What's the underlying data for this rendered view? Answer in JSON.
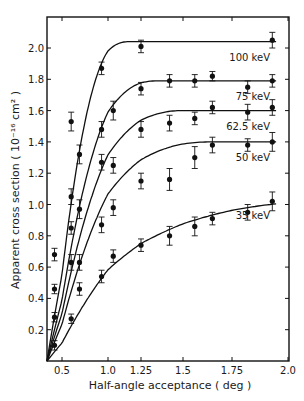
{
  "chart_data": {
    "type": "line",
    "title": "",
    "xlabel": "Half-angle acceptance ( deg )",
    "ylabel": "Apparent cross section ( 10⁻¹⁶ cm² )",
    "xlim": [
      0.4,
      2.0
    ],
    "ylim": [
      0,
      2.2
    ],
    "grid": false,
    "legend_position": "inline labels at right",
    "x_ticks": [
      {
        "label": "0.5",
        "px": 62
      },
      {
        "label": "1.0",
        "px": 108
      },
      {
        "label": "1.25",
        "px": 141
      },
      {
        "label": "1.5",
        "px": 183
      },
      {
        "label": "1.75",
        "px": 232
      },
      {
        "label": "2.0",
        "px": 288
      }
    ],
    "y_ticks": [
      "0.2",
      "0.4",
      "0.6",
      "0.8",
      "1.0",
      "1.2",
      "1.4",
      "1.6",
      "1.8",
      "2.0"
    ],
    "series": [
      {
        "name": "100 keV",
        "label": "100 keV",
        "plateau": 2.04,
        "points": [
          {
            "x": 0.6,
            "y": 1.53,
            "err": 0.06
          },
          {
            "x": 0.93,
            "y": 1.87,
            "err": 0.04
          },
          {
            "x": 1.25,
            "y": 2.01,
            "err": 0.04
          },
          {
            "x": 1.93,
            "y": 2.05,
            "err": 0.05
          }
        ]
      },
      {
        "name": "75 keV",
        "label": "75 keV",
        "plateau": 1.79,
        "points": [
          {
            "x": 0.45,
            "y": 0.68,
            "err": 0.04
          },
          {
            "x": 0.69,
            "y": 1.32,
            "err": 0.06
          },
          {
            "x": 0.93,
            "y": 1.48,
            "err": 0.05
          },
          {
            "x": 1.04,
            "y": 1.6,
            "err": 0.06
          },
          {
            "x": 1.25,
            "y": 1.74,
            "err": 0.04
          },
          {
            "x": 1.42,
            "y": 1.79,
            "err": 0.04
          },
          {
            "x": 1.56,
            "y": 1.79,
            "err": 0.04
          },
          {
            "x": 1.65,
            "y": 1.82,
            "err": 0.03
          },
          {
            "x": 1.82,
            "y": 1.75,
            "err": 0.04
          },
          {
            "x": 1.93,
            "y": 1.79,
            "err": 0.04
          }
        ]
      },
      {
        "name": "62.5 keV",
        "label": "62.5 keV",
        "plateau": 1.6,
        "points": [
          {
            "x": 0.45,
            "y": 0.46,
            "err": 0.03
          },
          {
            "x": 0.6,
            "y": 1.05,
            "err": 0.05
          },
          {
            "x": 0.69,
            "y": 0.97,
            "err": 0.06
          },
          {
            "x": 0.93,
            "y": 1.27,
            "err": 0.05
          },
          {
            "x": 1.04,
            "y": 1.25,
            "err": 0.05
          },
          {
            "x": 1.25,
            "y": 1.48,
            "err": 0.05
          },
          {
            "x": 1.42,
            "y": 1.52,
            "err": 0.05
          },
          {
            "x": 1.56,
            "y": 1.55,
            "err": 0.04
          },
          {
            "x": 1.65,
            "y": 1.62,
            "err": 0.04
          },
          {
            "x": 1.82,
            "y": 1.59,
            "err": 0.05
          },
          {
            "x": 1.93,
            "y": 1.62,
            "err": 0.05
          }
        ]
      },
      {
        "name": "50 keV",
        "label": "50 keV",
        "plateau": 1.4,
        "points": [
          {
            "x": 0.45,
            "y": 0.28,
            "err": 0.03
          },
          {
            "x": 0.6,
            "y": 0.85,
            "err": 0.04
          },
          {
            "x": 0.6,
            "y": 0.63,
            "err": 0.05
          },
          {
            "x": 0.69,
            "y": 0.63,
            "err": 0.05
          },
          {
            "x": 0.93,
            "y": 0.87,
            "err": 0.05
          },
          {
            "x": 1.04,
            "y": 0.98,
            "err": 0.05
          },
          {
            "x": 1.25,
            "y": 1.15,
            "err": 0.05
          },
          {
            "x": 1.42,
            "y": 1.16,
            "err": 0.07
          },
          {
            "x": 1.56,
            "y": 1.3,
            "err": 0.07
          },
          {
            "x": 1.65,
            "y": 1.38,
            "err": 0.05
          },
          {
            "x": 1.82,
            "y": 1.38,
            "err": 0.04
          },
          {
            "x": 1.93,
            "y": 1.4,
            "err": 0.06
          }
        ]
      },
      {
        "name": "35 keV",
        "label": "35 keV",
        "plateau": 1.03,
        "points": [
          {
            "x": 0.45,
            "y": 0.1,
            "err": 0.03
          },
          {
            "x": 0.6,
            "y": 0.27,
            "err": 0.03
          },
          {
            "x": 0.69,
            "y": 0.46,
            "err": 0.04
          },
          {
            "x": 0.93,
            "y": 0.54,
            "err": 0.04
          },
          {
            "x": 1.04,
            "y": 0.67,
            "err": 0.04
          },
          {
            "x": 1.25,
            "y": 0.74,
            "err": 0.04
          },
          {
            "x": 1.42,
            "y": 0.8,
            "err": 0.06
          },
          {
            "x": 1.56,
            "y": 0.86,
            "err": 0.06
          },
          {
            "x": 1.65,
            "y": 0.91,
            "err": 0.04
          },
          {
            "x": 1.82,
            "y": 0.95,
            "err": 0.05
          },
          {
            "x": 1.93,
            "y": 1.02,
            "err": 0.06
          }
        ]
      }
    ]
  }
}
